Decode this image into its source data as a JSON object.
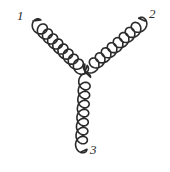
{
  "figure": {
    "kind": "feynman-diagram",
    "name": "three-gluon-vertex",
    "background_color": "#ffffff",
    "ink_color": "#2b2b2b",
    "width": 170,
    "height": 172
  },
  "labels": {
    "leg1": "1",
    "leg2": "2",
    "leg3": "3"
  },
  "chart_data": {
    "type": "diagram",
    "title": "",
    "vertex": {
      "x": 85,
      "y": 72,
      "label": "three-gluon vertex"
    },
    "legs": [
      {
        "id": "leg1",
        "label": "1",
        "particle": "gluon",
        "style": "coil",
        "start": {
          "x": 33,
          "y": 21
        },
        "end": {
          "x": 85,
          "y": 72
        },
        "coil_count": 9,
        "coil_radius": 6.2,
        "label_position": {
          "x": 20,
          "y": 16
        }
      },
      {
        "id": "leg2",
        "label": "2",
        "particle": "gluon",
        "style": "coil",
        "start": {
          "x": 85,
          "y": 72
        },
        "end": {
          "x": 145,
          "y": 21
        },
        "coil_count": 9,
        "coil_radius": 6.2,
        "label_position": {
          "x": 152,
          "y": 14
        }
      },
      {
        "id": "leg3",
        "label": "3",
        "particle": "gluon",
        "style": "coil",
        "start": {
          "x": 85,
          "y": 72
        },
        "end": {
          "x": 81,
          "y": 152
        },
        "coil_count": 8,
        "coil_radius": 5.8,
        "label_position": {
          "x": 93,
          "y": 150
        }
      }
    ],
    "xlabel": "",
    "ylabel": "",
    "legend": [],
    "grid": false
  }
}
